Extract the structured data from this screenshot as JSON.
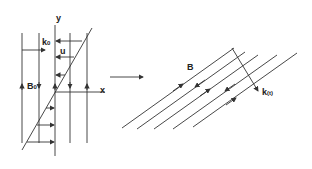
{
  "left_panel": {
    "axis_y": "y",
    "axis_x": "x",
    "wavevector": {
      "base": "k",
      "sub": "0"
    },
    "velocity": "u",
    "field": {
      "base": "B",
      "sub": "0"
    }
  },
  "transition_arrow": "right-arrow",
  "right_panel": {
    "field": "B",
    "wavevector": {
      "base": "k",
      "sub": "(t)"
    }
  },
  "colors": {
    "line": "#333333",
    "background": "#ffffff"
  }
}
